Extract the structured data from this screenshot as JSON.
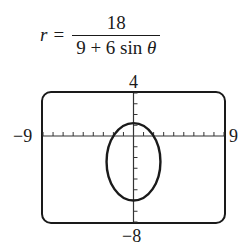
{
  "equation": {
    "lhs": "r",
    "equals": "=",
    "numerator": "18",
    "denominator_prefix": "9 + 6 sin ",
    "denominator_var": "θ"
  },
  "window": {
    "xmin_label": "−9",
    "xmax_label": "9",
    "ymax_label": "4",
    "ymin_label": "−8"
  },
  "chart_data": {
    "type": "line",
    "xlabel": "",
    "ylabel": "",
    "xlim": [
      -9,
      9
    ],
    "ylim": [
      -8,
      4
    ],
    "xscale": 1,
    "yscale": 1,
    "grid": false,
    "series": [
      {
        "name": "r = 18/(9 + 6 sin θ)",
        "kind": "polar-ellipse",
        "eccentricity": 0.6667,
        "center": [
          0,
          -2.4
        ],
        "semi_major_y": 3.6,
        "semi_minor_x": 2.68,
        "vertices": [
          [
            0,
            1.2
          ],
          [
            0,
            -6
          ]
        ],
        "x_intercepts": [
          [
            -2,
            0
          ],
          [
            2,
            0
          ]
        ]
      }
    ],
    "colors": {
      "curve": "#1a1a1a",
      "axes": "#333333",
      "frame": "#1a1a1a"
    }
  }
}
